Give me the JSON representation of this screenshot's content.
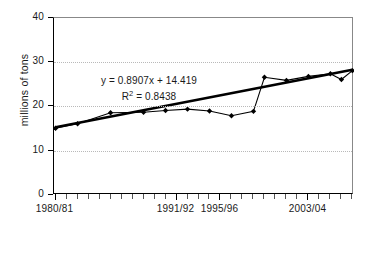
{
  "chart_data": {
    "type": "line",
    "title": "",
    "xlabel": "",
    "ylabel": "millions of tons",
    "ylim": [
      0,
      40
    ],
    "yticks": [
      0,
      10,
      20,
      30,
      40
    ],
    "grid": true,
    "legend": false,
    "x_tick_labels": [
      {
        "index": 0,
        "label": "1980/81"
      },
      {
        "index": 11,
        "label": "1991/92"
      },
      {
        "index": 15,
        "label": "1995/96"
      },
      {
        "index": 23,
        "label": "2003/04"
      }
    ],
    "x_categories": [
      "1980/81",
      "1981/82",
      "1982/83",
      "1983/84",
      "1984/85",
      "1985/86",
      "1986/87",
      "1987/88",
      "1988/89",
      "1989/90",
      "1990/91",
      "1991/92",
      "1992/93",
      "1993/94",
      "1994/95",
      "1995/96",
      "1996/97",
      "1997/98",
      "1998/99",
      "1999/00",
      "2000/01",
      "2001/02",
      "2002/03",
      "2003/04",
      "2004/05",
      "2005/06",
      "2006/07",
      "2007/08"
    ],
    "series": [
      {
        "name": "millions of tons",
        "marker": "diamond",
        "color": "#000000",
        "x_index": [
          0,
          2,
          5,
          8,
          10,
          12,
          14,
          16,
          18,
          19,
          21,
          23,
          25,
          26,
          27
        ],
        "values": [
          15.1,
          16.1,
          18.6,
          18.7,
          19.1,
          19.4,
          19.0,
          17.9,
          18.9,
          26.6,
          25.9,
          26.8,
          27.4,
          26.1,
          28.1
        ]
      }
    ],
    "trendline": {
      "equation": "y = 0.8907x + 14.419",
      "r_squared_label": "R",
      "r_squared_sup": "2",
      "r_squared_value": "= 0.8438",
      "slope": 0.8907,
      "intercept": 14.419,
      "r2": 0.8438,
      "color": "#000000",
      "start_value": 15.3,
      "end_value": 28.3
    },
    "annotations": [
      "y = 0.8907x + 14.419",
      "R2 = 0.8438"
    ],
    "colors": {
      "axis": "#000000",
      "grid": "#b9b9b9",
      "series": "#000000",
      "trend": "#000000",
      "text": "#1a1a1a",
      "background": "#ffffff"
    }
  }
}
